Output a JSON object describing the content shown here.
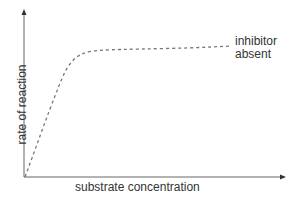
{
  "chart_data": {
    "type": "line",
    "title": "",
    "xlabel": "substrate concentration",
    "ylabel": "rate of reaction",
    "grid": false,
    "ticks": "none",
    "series": [
      {
        "name": "inhibitor absent",
        "style": "dashed",
        "color": "#777777",
        "points_px": [
          [
            25,
            177
          ],
          [
            35,
            150
          ],
          [
            45,
            122
          ],
          [
            55,
            96
          ],
          [
            62,
            78
          ],
          [
            68,
            66
          ],
          [
            76,
            57
          ],
          [
            86,
            52
          ],
          [
            100,
            50
          ],
          [
            140,
            49
          ],
          [
            190,
            48
          ],
          [
            232,
            46
          ]
        ]
      }
    ],
    "annotation": {
      "text_line1": "inhibitor",
      "text_line2": "absent"
    },
    "axes": {
      "color": "#666666",
      "origin_px": [
        24,
        177
      ],
      "x_end_px": 286,
      "y_end_px": 9
    }
  }
}
